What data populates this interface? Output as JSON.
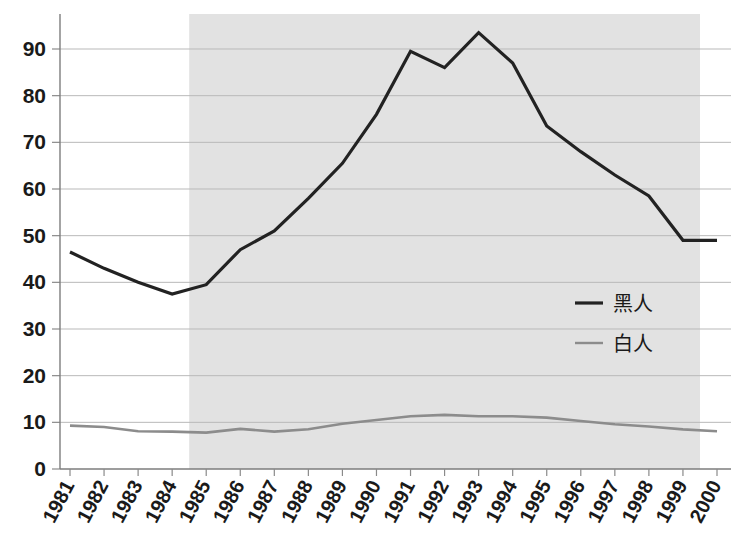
{
  "chart_data": {
    "type": "line",
    "title": "",
    "xlabel": "",
    "ylabel": "",
    "xlim": [
      1981,
      2000
    ],
    "ylim": [
      0,
      95
    ],
    "yticks": [
      0,
      10,
      20,
      30,
      40,
      50,
      60,
      70,
      80,
      90
    ],
    "grid": true,
    "legend_position": "center-right",
    "categories": [
      "1981",
      "1982",
      "1983",
      "1984",
      "1985",
      "1986",
      "1987",
      "1988",
      "1989",
      "1990",
      "1991",
      "1992",
      "1993",
      "1994",
      "1995",
      "1996",
      "1997",
      "1998",
      "1999",
      "2000"
    ],
    "series": [
      {
        "name": "黑人",
        "color": "#222222",
        "linewidth": 3.2,
        "values": [
          46.5,
          43.0,
          40.0,
          37.5,
          39.5,
          47.0,
          51.0,
          58.0,
          65.5,
          76.0,
          89.5,
          86.0,
          93.5,
          87.0,
          73.5,
          68.0,
          63.0,
          58.5,
          49.0,
          49.0
        ]
      },
      {
        "name": "白人",
        "color": "#8c8c8c",
        "linewidth": 2.6,
        "values": [
          9.3,
          9.0,
          8.1,
          8.0,
          7.8,
          8.6,
          8.0,
          8.5,
          9.7,
          10.5,
          11.3,
          11.6,
          11.3,
          11.3,
          11.0,
          10.3,
          9.6,
          9.1,
          8.5,
          8.1
        ]
      }
    ],
    "shaded_region": {
      "label": "",
      "x_start": 1984.5,
      "x_end": 1999.5,
      "color": "#e2e2e2"
    },
    "legend_entries": [
      {
        "label": "黑人",
        "color": "#222222"
      },
      {
        "label": "白人",
        "color": "#8c8c8c"
      }
    ]
  },
  "axes": {
    "y_tick_labels": [
      "90",
      "80",
      "70",
      "60",
      "50",
      "40",
      "30",
      "20",
      "10",
      "0"
    ],
    "x_tick_labels": [
      "1981",
      "1982",
      "1983",
      "1984",
      "1985",
      "1986",
      "1987",
      "1988",
      "1989",
      "1990",
      "1991",
      "1992",
      "1993",
      "1994",
      "1995",
      "1996",
      "1997",
      "1998",
      "1999",
      "2000"
    ]
  },
  "legend": {
    "items": [
      {
        "label": "黑人"
      },
      {
        "label": "白人"
      }
    ]
  },
  "colors": {
    "black_series": "#222222",
    "white_series": "#8c8c8c",
    "shade": "#e2e2e2",
    "gridline": "#b9b9b9",
    "axis": "#7d7d7d",
    "text": "#1a1a1a",
    "background": "#ffffff"
  }
}
